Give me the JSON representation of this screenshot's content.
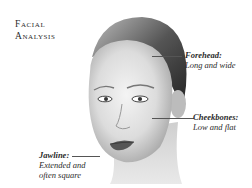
{
  "title": {
    "line1": "Facial",
    "line2": "Analysis"
  },
  "image": {
    "alt": "Portrait of a woman with slicked-back hair"
  },
  "annotations": [
    {
      "id": "forehead",
      "term": "Forehead:",
      "description": "Long and wide"
    },
    {
      "id": "cheekbones",
      "term": "Cheekbones:",
      "description": "Low and flat"
    },
    {
      "id": "jawline",
      "term": "Jawline:",
      "description_line1": "Extended and",
      "description_line2": "often square"
    }
  ]
}
